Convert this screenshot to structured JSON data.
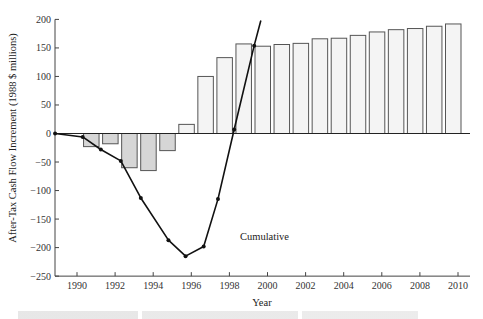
{
  "chart_data": {
    "type": "bar",
    "title": "",
    "xlabel": "Year",
    "ylabel": "After-Tax Cash Flow Increment (1988 $ millions)",
    "ylim": [
      -250,
      200
    ],
    "xlim": [
      1989,
      2010.5
    ],
    "grid": false,
    "legend": "none",
    "y_ticks": [
      200,
      150,
      100,
      50,
      0,
      -50,
      -100,
      -150,
      -200,
      -250
    ],
    "x_ticks": [
      1990,
      1992,
      1994,
      1996,
      1998,
      2000,
      2002,
      2004,
      2006,
      2008,
      2010
    ],
    "annotations": [
      {
        "text": "Cumulative",
        "x": 1999.6,
        "y": -180
      }
    ],
    "series": [
      {
        "name": "Annual after-tax cash flow increment",
        "type": "bar",
        "x": [
          1991,
          1992,
          1993,
          1994,
          1995,
          1996,
          1997,
          1998,
          1999,
          2000,
          2001,
          2002,
          2003,
          2004,
          2005,
          2006,
          2007,
          2008,
          2009,
          2010
        ],
        "values": [
          -23,
          -18,
          -60,
          -65,
          -30,
          16,
          100,
          133,
          157,
          153,
          156,
          158,
          166,
          167,
          172,
          178,
          182,
          184,
          188,
          192
        ]
      },
      {
        "name": "Cumulative",
        "type": "line",
        "x": [
          1988.85,
          1990.3,
          1991.25,
          1992.3,
          1993.35,
          1994.8,
          1995.7,
          1996.65,
          1997.4,
          1998.25,
          1999.3,
          1999.65
        ],
        "values": [
          0,
          -6,
          -28,
          -48,
          -113,
          -187,
          -215,
          -198,
          -115,
          7,
          154,
          198
        ]
      }
    ]
  },
  "axes": {
    "xlabel": "Year",
    "ylabel": "After-Tax Cash Flow Increment (1988 $ millions)"
  },
  "colors": {
    "positive_bar_fill": "#f4f4f4",
    "negative_bar_fill": "#d6d6d6",
    "bar_stroke": "#555555",
    "line": "#111111",
    "axis": "#444444"
  }
}
